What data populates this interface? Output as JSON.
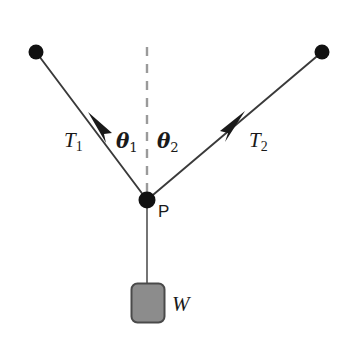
{
  "figure": {
    "type": "free-body-diagram",
    "background_color": "#ffffff",
    "line_color": "#3a3a3a",
    "node_color": "#111111",
    "block_fill": "#8c8c8c",
    "block_stroke": "#4a4a4a",
    "dash_color": "#9a9a9a"
  },
  "labels": {
    "tension_left": "T",
    "tension_left_sub": "1",
    "tension_right": "T",
    "tension_right_sub": "2",
    "theta_left": "θ",
    "theta_left_sub": "1",
    "theta_right": "θ",
    "theta_right_sub": "2",
    "point": "P",
    "weight": "W"
  },
  "geometry": {
    "anchor_left": {
      "x": 36,
      "y": 52,
      "r": 7.5
    },
    "anchor_right": {
      "x": 322,
      "y": 52,
      "r": 7.5
    },
    "point_p": {
      "x": 147,
      "y": 200,
      "r": 8.5
    },
    "dashed_line": {
      "x": 147,
      "y_top": 47,
      "y_bottom": 198
    },
    "rod": {
      "x": 147,
      "y_top": 200,
      "y_bottom": 284
    },
    "block": {
      "x": 131,
      "y": 283,
      "w": 34,
      "h": 40,
      "radius": 6
    },
    "arrow_left_tip": {
      "x": 88,
      "y": 112
    },
    "arrow_right_tip": {
      "x": 245,
      "y": 111
    }
  }
}
